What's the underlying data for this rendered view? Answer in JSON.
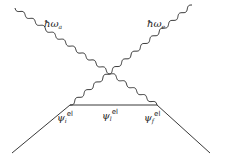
{
  "diagram": {
    "photons": [
      {
        "symbol": "ħω",
        "sub": "a"
      },
      {
        "symbol": "ħω",
        "sub": "e"
      }
    ],
    "states": [
      {
        "symbol": "ψ",
        "sub": "i",
        "sup": "el"
      },
      {
        "symbol": "ψ",
        "sub": "l",
        "sup": "el"
      },
      {
        "symbol": "ψ",
        "sub": "f",
        "sup": "el"
      }
    ],
    "line_color": "#222222"
  }
}
